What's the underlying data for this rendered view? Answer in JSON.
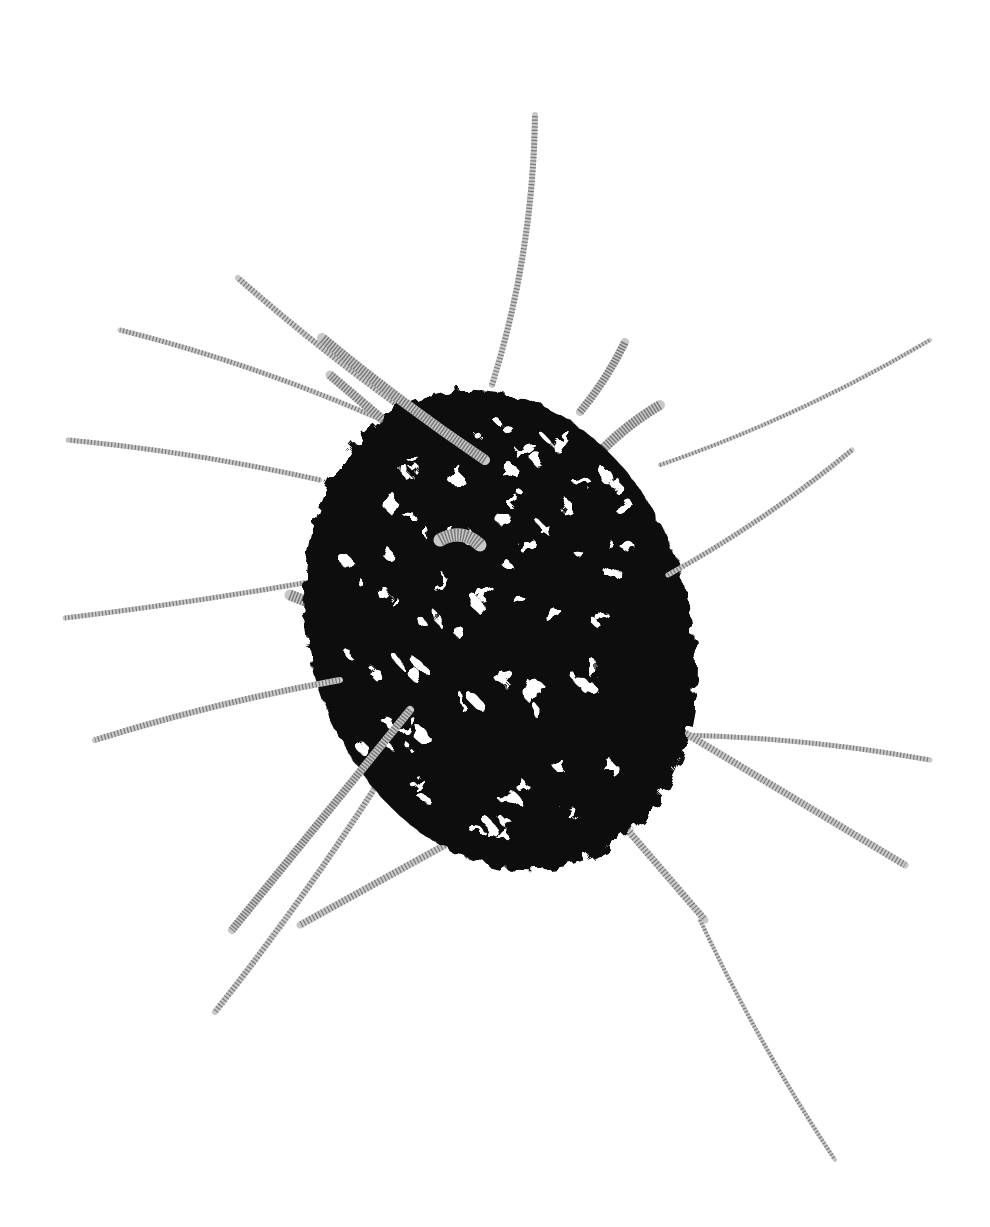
{
  "image": {
    "subject": "black fibrous sculpture with metal springs",
    "background": "#ffffff",
    "body_color": "#0a0a0a",
    "spring_color": "#7a7a7a"
  },
  "body": {
    "cx": 500,
    "cy": 630,
    "rx": 190,
    "ry": 245,
    "rotate": -18
  },
  "springs": [
    {
      "x1": 492,
      "y1": 385,
      "x2": 535,
      "y2": 115,
      "w": 5,
      "curve": 20
    },
    {
      "x1": 470,
      "y1": 455,
      "x2": 238,
      "y2": 278,
      "w": 5,
      "curve": -10
    },
    {
      "x1": 415,
      "y1": 435,
      "x2": 120,
      "y2": 330,
      "w": 4,
      "curve": 15
    },
    {
      "x1": 485,
      "y1": 460,
      "x2": 322,
      "y2": 338,
      "w": 9,
      "curve": -5
    },
    {
      "x1": 395,
      "y1": 430,
      "x2": 330,
      "y2": 375,
      "w": 8,
      "curve": 0
    },
    {
      "x1": 320,
      "y1": 480,
      "x2": 68,
      "y2": 440,
      "w": 4,
      "curve": 8
    },
    {
      "x1": 580,
      "y1": 412,
      "x2": 625,
      "y2": 342,
      "w": 7,
      "curve": 5
    },
    {
      "x1": 580,
      "y1": 475,
      "x2": 660,
      "y2": 405,
      "w": 9,
      "curve": -10
    },
    {
      "x1": 660,
      "y1": 465,
      "x2": 930,
      "y2": 340,
      "w": 3,
      "curve": 15
    },
    {
      "x1": 668,
      "y1": 575,
      "x2": 852,
      "y2": 450,
      "w": 4,
      "curve": 10
    },
    {
      "x1": 365,
      "y1": 572,
      "x2": 65,
      "y2": 618,
      "w": 4,
      "curve": -5
    },
    {
      "x1": 290,
      "y1": 595,
      "x2": 405,
      "y2": 640,
      "w": 10,
      "curve": 0
    },
    {
      "x1": 340,
      "y1": 680,
      "x2": 95,
      "y2": 740,
      "w": 5,
      "curve": 8
    },
    {
      "x1": 490,
      "y1": 668,
      "x2": 570,
      "y2": 755,
      "w": 10,
      "curve": 0
    },
    {
      "x1": 490,
      "y1": 670,
      "x2": 705,
      "y2": 920,
      "w": 6,
      "curve": 0
    },
    {
      "x1": 700,
      "y1": 920,
      "x2": 835,
      "y2": 1160,
      "w": 3,
      "curve": 10
    },
    {
      "x1": 680,
      "y1": 735,
      "x2": 930,
      "y2": 760,
      "w": 4,
      "curve": -10
    },
    {
      "x1": 680,
      "y1": 730,
      "x2": 905,
      "y2": 865,
      "w": 6,
      "curve": 0
    },
    {
      "x1": 410,
      "y1": 710,
      "x2": 232,
      "y2": 930,
      "w": 7,
      "curve": 0
    },
    {
      "x1": 405,
      "y1": 740,
      "x2": 215,
      "y2": 1012,
      "w": 5,
      "curve": -10
    },
    {
      "x1": 445,
      "y1": 845,
      "x2": 300,
      "y2": 925,
      "w": 6,
      "curve": 0
    },
    {
      "x1": 440,
      "y1": 540,
      "x2": 480,
      "y2": 545,
      "w": 12,
      "curve": -15
    }
  ],
  "holes_seed": 42
}
